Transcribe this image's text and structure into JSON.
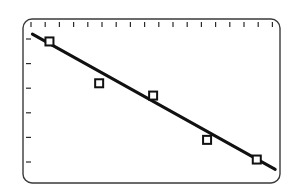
{
  "chart_data": {
    "type": "scatter",
    "title": "",
    "xlabel": "",
    "ylabel": "",
    "grid": false,
    "legend": null,
    "x_ticks_count": 18,
    "y_ticks_count": 6,
    "tick_labels": {
      "x": [],
      "y": []
    },
    "units_note": "No axis labels shown; values expressed in tick units (x: tick 0 = first top tick, y: tick 0 = lowest left tick)",
    "xlim": [
      -0.6,
      17.3
    ],
    "ylim": [
      -0.8,
      6.0
    ],
    "series": [
      {
        "name": "data",
        "marker": "square-open",
        "x": [
          1.3,
          4.8,
          8.6,
          12.4,
          15.9
        ],
        "y": [
          4.9,
          3.2,
          2.7,
          0.9,
          0.1
        ]
      },
      {
        "name": "regression-line",
        "type": "line",
        "x": [
          0.1,
          17.2
        ],
        "y": [
          5.2,
          -0.3
        ]
      }
    ],
    "colors": {
      "frame": "#3a3a3a",
      "line": "#111111",
      "marker": "#111111",
      "background": "#ffffff"
    }
  }
}
